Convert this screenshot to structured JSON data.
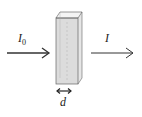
{
  "diagram": {
    "incident_label": "I",
    "incident_subscript": "0",
    "transmitted_label": "I",
    "path_length_label": "d",
    "colors": {
      "stroke": "#333333",
      "liquid": "#d8d8d8",
      "background": "#ffffff"
    }
  }
}
